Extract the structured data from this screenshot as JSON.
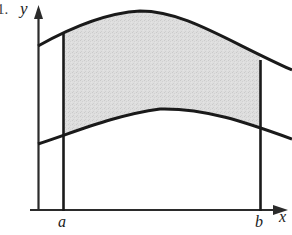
{
  "figure": {
    "figure_number": "1.",
    "axis_labels": {
      "x": "x",
      "y": "y"
    },
    "tick_labels": {
      "left_bound": "a",
      "right_bound": "b"
    },
    "colors": {
      "ink": "#1a1a1a",
      "shading": "#dcdcdc",
      "background": "#ffffff",
      "axis": "#2b2b2b"
    },
    "geometry": {
      "origin": {
        "x": 38,
        "y": 210
      },
      "x_axis_end": {
        "x": 287,
        "y": 210
      },
      "y_axis_top": {
        "x": 38,
        "y": 6
      },
      "a_line_x": 63,
      "b_line_x": 260,
      "upper_curve": "M 38 46 C 70 28, 105 13, 140 11 C 185 11, 225 40, 292 70",
      "lower_curve": "M 38 144 C 75 132, 115 115, 160 109 C 205 108, 245 122, 292 139"
    }
  }
}
